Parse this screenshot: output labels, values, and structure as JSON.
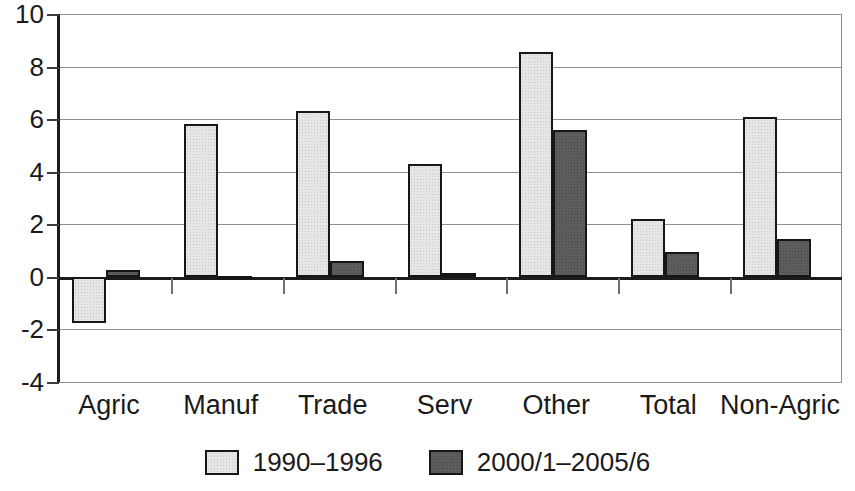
{
  "chart_data": {
    "type": "bar",
    "title": "",
    "subtitle": "",
    "xlabel": "",
    "ylabel": "",
    "categories": [
      "Agric",
      "Manuf",
      "Trade",
      "Serv",
      "Other",
      "Total",
      "Non-Agric"
    ],
    "series": [
      {
        "name": "1990–1996",
        "color": "#e6e6e6",
        "values": [
          -1.75,
          5.8,
          6.3,
          4.3,
          8.55,
          2.2,
          6.1
        ]
      },
      {
        "name": "2000/1–2005/6",
        "color": "#5c5c5c",
        "values": [
          0.25,
          0.05,
          0.6,
          0.15,
          5.6,
          0.95,
          1.45
        ]
      }
    ],
    "ylim": [
      -4,
      10
    ],
    "ytick_values": [
      10,
      8,
      6,
      4,
      2,
      0,
      -2,
      -4
    ],
    "ytick_labels": [
      "10",
      "8",
      "6",
      "4",
      "2",
      "0",
      "-2",
      "-4"
    ],
    "grid": true,
    "legend_position": "bottom",
    "legend": [
      {
        "label": "1990–1996",
        "swatch": "#e6e6e6"
      },
      {
        "label": "2000/1–2005/6",
        "swatch": "#5c5c5c"
      }
    ]
  }
}
